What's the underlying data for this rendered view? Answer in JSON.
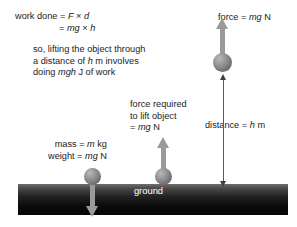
{
  "diagram": {
    "background_color": "#ffffff",
    "accent_color": "#9a9a9a",
    "ground_color": "#0b0b0b"
  },
  "equations": {
    "work_done_line1_label": "work done = ",
    "work_done_line1_var1": "F",
    "work_done_line1_op": " × ",
    "work_done_line1_var2": "d",
    "work_done_line2_eq": "= ",
    "work_done_line2_var1": "mg",
    "work_done_line2_op": " × ",
    "work_done_line2_var2": "h"
  },
  "explanation": {
    "line1": "so, lifting the object through",
    "line2_pre": "a distance of ",
    "line2_var": "h",
    "line2_post": " m involves",
    "line3_pre": "doing ",
    "line3_var": "mgh",
    "line3_post": " J of work"
  },
  "labels": {
    "force_top_pre": "force = ",
    "force_top_var": "mg",
    "force_top_post": " N",
    "force_required_line1": "force required",
    "force_required_line2": "to lift object",
    "force_required_line3_pre": "= ",
    "force_required_line3_var": "mg",
    "force_required_line3_post": " N",
    "distance_pre": "distance = ",
    "distance_var": "h",
    "distance_post": " m",
    "mass_pre": "mass = ",
    "mass_var": "m",
    "mass_post": " kg",
    "weight_pre": "weight = ",
    "weight_var": "mg",
    "weight_post": " N",
    "ground": "ground"
  }
}
